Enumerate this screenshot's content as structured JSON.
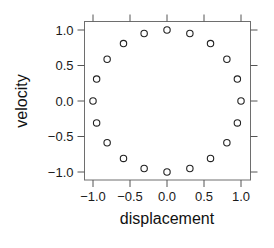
{
  "chart_data": {
    "type": "scatter",
    "title": "",
    "xlabel": "displacement",
    "ylabel": "velocity",
    "xlim": [
      -1.1,
      1.1
    ],
    "ylim": [
      -1.1,
      1.1
    ],
    "grid": false,
    "legend": null,
    "marker": "open-circle",
    "x_ticks": [
      -1.0,
      -0.5,
      0.0,
      0.5,
      1.0
    ],
    "x_tick_labels": [
      "−1.0",
      "−0.5",
      "0.0",
      "0.5",
      "1.0"
    ],
    "y_ticks": [
      -1.0,
      -0.5,
      0.0,
      0.5,
      1.0
    ],
    "y_tick_labels": [
      "−1.0",
      "−0.5",
      "0.0",
      "0.5",
      "1.0"
    ],
    "series": [
      {
        "name": "phase",
        "x": [
          1.0,
          0.951,
          0.809,
          0.588,
          0.309,
          0.0,
          -0.309,
          -0.588,
          -0.809,
          -0.951,
          -1.0,
          -0.951,
          -0.809,
          -0.588,
          -0.309,
          0.0,
          0.309,
          0.588,
          0.809,
          0.951
        ],
        "y": [
          0.0,
          0.309,
          0.588,
          0.809,
          0.951,
          1.0,
          0.951,
          0.809,
          0.588,
          0.309,
          0.0,
          -0.309,
          -0.588,
          -0.809,
          -0.951,
          -1.0,
          -0.951,
          -0.809,
          -0.588,
          -0.309
        ]
      }
    ]
  },
  "colors": {
    "axis": "#555555",
    "marker": "#222222",
    "text": "#1a1a1a"
  }
}
